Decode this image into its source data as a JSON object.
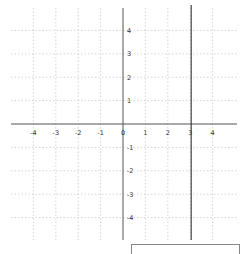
{
  "chart_data": {
    "type": "line",
    "title": "",
    "xlabel": "",
    "ylabel": "",
    "xlim": [
      -5,
      5
    ],
    "ylim": [
      -5,
      5
    ],
    "grid": true,
    "x_ticks": [
      -4,
      -3,
      -2,
      -1,
      0,
      1,
      2,
      3,
      4
    ],
    "y_ticks": [
      -4,
      -3,
      -2,
      -1,
      1,
      2,
      3,
      4
    ],
    "x_tick_labels": [
      "-4",
      "-3",
      "-2",
      "-1",
      "0",
      "1",
      "2",
      "3",
      "4"
    ],
    "y_tick_labels": [
      "4",
      "3",
      "2",
      "1",
      "-1",
      "-2",
      "-3",
      "-4"
    ],
    "series": [
      {
        "name": "x = 3",
        "kind": "vertical-line",
        "x": 3,
        "color": "#444444"
      }
    ],
    "legend": null
  },
  "colors": {
    "axis": "#555555",
    "grid": "#bbbbbb",
    "line": "#444444",
    "answer_box_border": "#888888"
  },
  "answer_box": {
    "value": ""
  }
}
